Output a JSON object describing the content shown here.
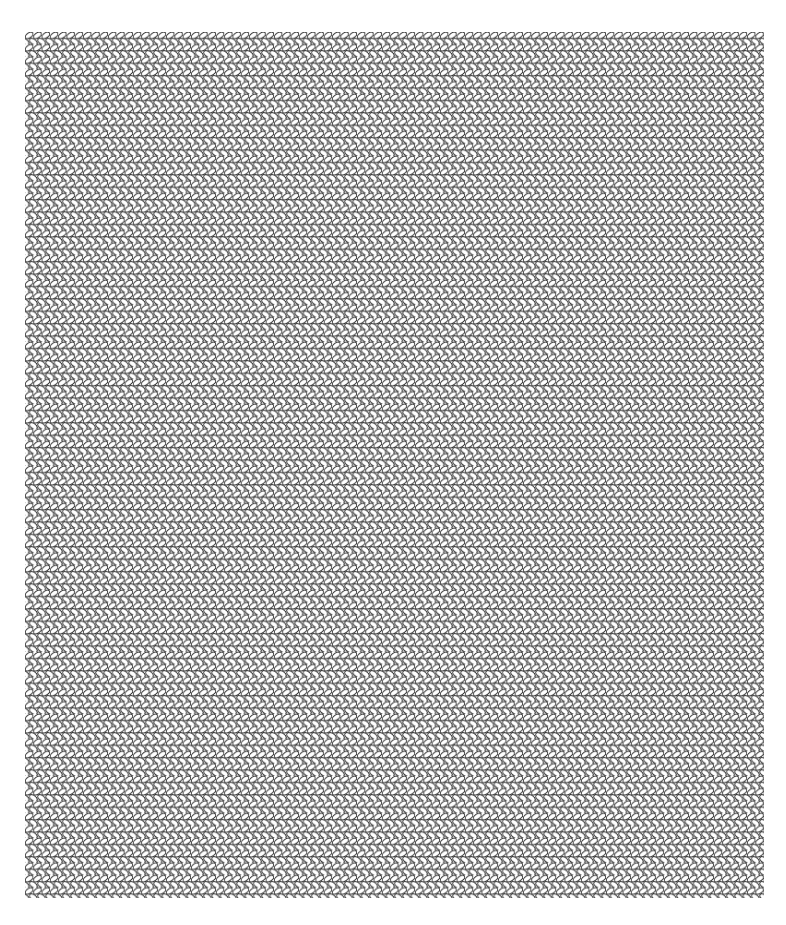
{
  "image": {
    "description": "Knitted stockinette stitch pattern of interlocking tilted oval loops",
    "background_color": "#ffffff",
    "stroke_color": "#222222",
    "fill_color": "#ffffff",
    "pattern_region": {
      "x": 25,
      "y": 32,
      "width": 739,
      "height": 866
    },
    "tile": {
      "width": 8.3,
      "height": 12.4
    },
    "loop": {
      "rx": 4.6,
      "ry": 2.6,
      "tilt_deg": 35,
      "stroke_width": 0.9
    }
  }
}
